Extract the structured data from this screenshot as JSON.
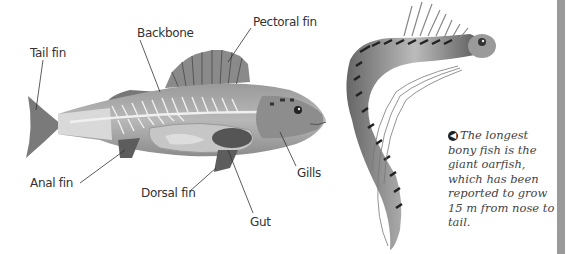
{
  "diagram": {
    "labels": {
      "tail_fin": "Tail fin",
      "backbone": "Backbone",
      "pectoral_fin": "Pectoral fin",
      "anal_fin": "Anal fin",
      "dorsal_fin": "Dorsal fin",
      "gut": "Gut",
      "gills": "Gills"
    }
  },
  "caption": {
    "bullet_icon": "arrow-left-circle",
    "text": "The longest bony fish is the giant oarfish, which has been reported to grow 15 m from nose to tail."
  },
  "colors": {
    "background": "#ffffff",
    "side_bar": "#9a9a9a",
    "fish_body": "#8a8a8a",
    "text": "#333333"
  }
}
